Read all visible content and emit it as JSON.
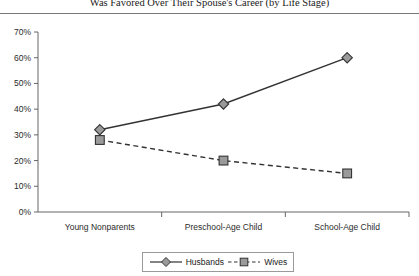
{
  "figure": {
    "title": "Was Favored Over Their Spouse's Career (by Life Stage)"
  },
  "legend": {
    "entries": [
      {
        "label": "Husbands",
        "marker": "diamond-marker",
        "line": "solid"
      },
      {
        "label": "Wives",
        "marker": "square-marker",
        "line": "dashed"
      }
    ]
  },
  "colors": {
    "line": "#333333",
    "marker_fill": "#9a9a9a",
    "marker_stroke": "#333333",
    "axis": "#666666",
    "rule": "#777777",
    "text": "#1a1a1a"
  },
  "chart_data": {
    "type": "line",
    "title": "Was Favored Over Their Spouse's Career (by Life Stage)",
    "xlabel": "",
    "ylabel": "",
    "categories": [
      "Young Nonparents",
      "Preschool-Age Child",
      "School-Age Child"
    ],
    "series": [
      {
        "name": "Husbands",
        "values": [
          32,
          42,
          60
        ],
        "style": "solid",
        "marker": "diamond"
      },
      {
        "name": "Wives",
        "values": [
          28,
          20,
          15
        ],
        "style": "dashed",
        "marker": "square"
      }
    ],
    "ylim": [
      0,
      70
    ],
    "yticks": [
      0,
      10,
      20,
      30,
      40,
      50,
      60,
      70
    ],
    "ytick_labels": [
      "0%",
      "10%",
      "20%",
      "30%",
      "40%",
      "50%",
      "60%",
      "70%"
    ],
    "grid": false,
    "legend_position": "bottom"
  }
}
